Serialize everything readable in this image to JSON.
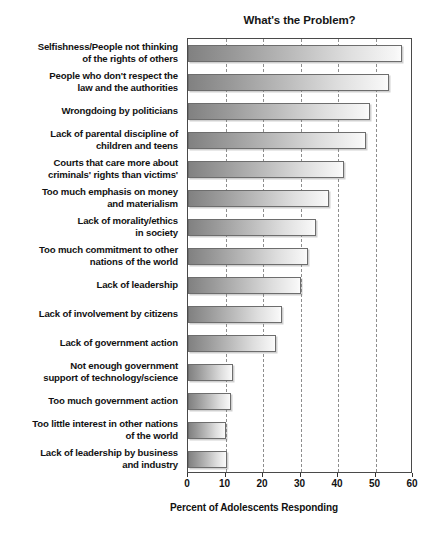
{
  "chart_data": {
    "type": "bar",
    "orientation": "horizontal",
    "title": "What's the Problem?",
    "xlabel": "Percent of Adolescents Responding",
    "ylabel": "",
    "xlim": [
      0,
      60
    ],
    "xticks": [
      0,
      10,
      20,
      30,
      40,
      50,
      60
    ],
    "xtick_labels": [
      "0",
      "10",
      "20",
      "30",
      "40",
      "50",
      "60"
    ],
    "grid": true,
    "grid_axis": "x",
    "grid_style": "dashed",
    "legend": false,
    "categories": [
      "Selfishness/People not thinking\nof the rights of others",
      "People who don't respect the\nlaw and the authorities",
      "Wrongdoing by politicians",
      "Lack of parental discipline of\nchildren and teens",
      "Courts that care more about\ncriminals' rights than victims'",
      "Too much emphasis on money\nand materialism",
      "Lack of morality/ethics\nin society",
      "Too much commitment to other\nnations of the world",
      "Lack of leadership",
      "Lack of involvement by citizens",
      "Lack of government action",
      "Not enough government\nsupport of technology/science",
      "Too much government action",
      "Too little interest in other nations\nof the world",
      "Lack of leadership by business\nand industry"
    ],
    "values": [
      57,
      53.5,
      48.5,
      47.5,
      41.5,
      37.5,
      34,
      32,
      30,
      25,
      23.5,
      12,
      11.5,
      10,
      10.5
    ],
    "bar_fill": "#bdbdbd",
    "bar_edge": "#6d6d6d",
    "axis_color": "#4a4a4a",
    "background": "#ffffff"
  }
}
